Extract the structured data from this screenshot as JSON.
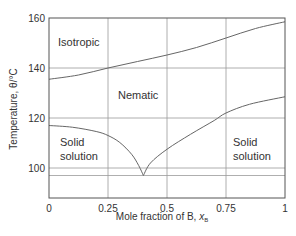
{
  "chart_data": {
    "type": "line",
    "title": "",
    "xlabel": "Mole fraction of B, x_B",
    "xlabel_main": "Mole fraction of B, ",
    "xlabel_var": "x",
    "xlabel_sub": "B",
    "ylabel": "Temperature, θ/°C",
    "xlim": [
      0,
      1
    ],
    "ylim": [
      88,
      160
    ],
    "grid": true,
    "x_ticks": [
      "0",
      "0.25",
      "0.5",
      "0.75",
      "1"
    ],
    "y_ticks": [
      "100",
      "120",
      "140",
      "160"
    ],
    "extra_hline": 97,
    "regions": [
      {
        "label": "Isotropic",
        "lines": [
          "Isotropic"
        ]
      },
      {
        "label": "Nematic",
        "lines": [
          "Nematic"
        ]
      },
      {
        "label": "Solid solution (left)",
        "lines": [
          "Solid",
          "solution"
        ]
      },
      {
        "label": "Solid solution (right)",
        "lines": [
          "Solid",
          "solution"
        ]
      }
    ],
    "series": [
      {
        "name": "Isotropic-Nematic boundary",
        "x": [
          0,
          0.125,
          0.25,
          0.375,
          0.5,
          0.625,
          0.75,
          0.875,
          1
        ],
        "y": [
          135.5,
          137.2,
          140,
          142.6,
          145.2,
          148.2,
          152,
          155.8,
          158.5
        ]
      },
      {
        "name": "Left solidus",
        "x": [
          0,
          0.1,
          0.2,
          0.25,
          0.3,
          0.35,
          0.38,
          0.4
        ],
        "y": [
          117,
          116.3,
          114.6,
          113,
          110.2,
          105.5,
          101,
          97
        ]
      },
      {
        "name": "Right solidus",
        "x": [
          0.4,
          0.43,
          0.5,
          0.6,
          0.7,
          0.75,
          0.85,
          1
        ],
        "y": [
          97,
          102,
          107.5,
          113.5,
          119,
          122,
          125.5,
          128.5
        ]
      }
    ],
    "eutectic": {
      "x": 0.4,
      "y": 97
    }
  }
}
